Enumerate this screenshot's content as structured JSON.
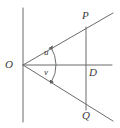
{
  "figure": {
    "kind": "geometry-diagram",
    "width": 120,
    "height": 128,
    "background_color": "#ffffff",
    "stroke_color": "#6b6b6b",
    "label_color": "#3a3a3a",
    "stroke_width": 1
  },
  "labels": {
    "vertex_o": "O",
    "point_p": "P",
    "point_q": "Q",
    "point_d": "D",
    "angle_u": "u",
    "angle_v": "v"
  },
  "geometry": {
    "vertex": {
      "name": "O",
      "x": 23,
      "y": 65
    },
    "points": [
      {
        "name": "P",
        "x": 86,
        "y": 27
      },
      {
        "name": "D",
        "x": 86,
        "y": 65
      },
      {
        "name": "Q",
        "x": 86,
        "y": 110
      }
    ],
    "vertical_line": {
      "x": 23,
      "y1": 8,
      "y2": 122
    },
    "segment_pq": {
      "x": 86,
      "y1": 27,
      "y2": 110
    },
    "rays": [
      {
        "name": "ray-op",
        "x1": 23,
        "y1": 65,
        "x2": 113,
        "y2": 13
      },
      {
        "name": "ray-od",
        "x1": 23,
        "y1": 65,
        "x2": 112,
        "y2": 65
      },
      {
        "name": "ray-oq",
        "x1": 23,
        "y1": 65,
        "x2": 113,
        "y2": 121
      }
    ],
    "angle_arc": {
      "name": "double-headed-angle-arc",
      "center_x": 23,
      "center_y": 65,
      "radius": 33,
      "start_angle_deg": -30,
      "end_angle_deg": 32
    }
  },
  "label_positions": {
    "vertex_o": {
      "x": 5,
      "y": 59
    },
    "point_p": {
      "x": 82,
      "y": 10
    },
    "point_q": {
      "x": 82,
      "y": 110
    },
    "point_d": {
      "x": 89,
      "y": 67
    },
    "angle_u": {
      "x": 44,
      "y": 48
    },
    "angle_v": {
      "x": 44,
      "y": 68
    }
  }
}
